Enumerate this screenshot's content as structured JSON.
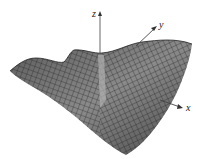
{
  "figure": {
    "axes": {
      "x_label": "x",
      "y_label": "y",
      "z_label": "z"
    },
    "colors": {
      "surface_fill": "#6e6e6e",
      "mesh_line": "#1e1e1e",
      "axis_line": "#555555",
      "background": "#ffffff"
    }
  }
}
